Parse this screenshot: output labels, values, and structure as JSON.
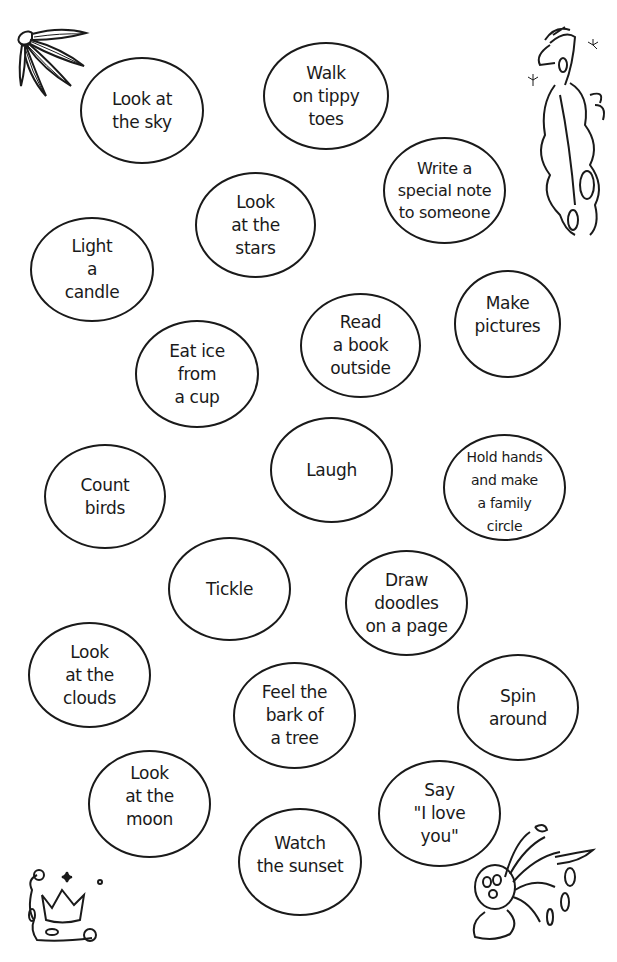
{
  "page": {
    "background": "#ffffff",
    "ink_color": "#1a1a1a"
  },
  "bubbles": [
    {
      "label": "Look at\nthe sky"
    },
    {
      "label": "Walk\non tippy\ntoes"
    },
    {
      "label": "Write a\nspecial note\nto someone"
    },
    {
      "label": "Look\nat the\nstars"
    },
    {
      "label": "Light\na\ncandle"
    },
    {
      "label": "Make\npictures"
    },
    {
      "label": "Read\na book\noutside"
    },
    {
      "label": "Eat ice\nfrom\na cup"
    },
    {
      "label": "Laugh"
    },
    {
      "label": "Count\nbirds"
    },
    {
      "label": "Hold hands\nand make\na family\ncircle"
    },
    {
      "label": "Tickle"
    },
    {
      "label": "Draw\ndoodles\non a page"
    },
    {
      "label": "Look\nat the\nclouds"
    },
    {
      "label": "Feel the\nbark of\na tree"
    },
    {
      "label": "Spin\naround"
    },
    {
      "label": "Look\nat the\nmoon"
    },
    {
      "label": "Watch\nthe sunset"
    },
    {
      "label": "Say\n\"I love\nyou\""
    }
  ],
  "decorations": {
    "top_left": "flower-icon",
    "top_right": "bird-icon",
    "bottom_left": "crown-icon",
    "bottom_right": "creature-icon"
  }
}
